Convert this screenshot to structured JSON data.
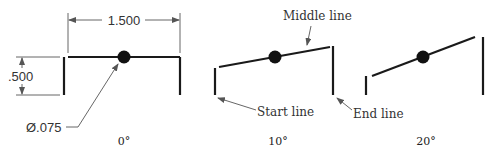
{
  "figure": {
    "panels": [
      {
        "angle_label": "0°",
        "dimensions": {
          "length": "1.500",
          "height": ".500",
          "dot_diameter": "Ø.075"
        }
      },
      {
        "angle_label": "10°",
        "callouts": {
          "middle": "Middle line",
          "start": "Start line",
          "end": "End line"
        }
      },
      {
        "angle_label": "20°"
      }
    ],
    "colors": {
      "line": "#1a1a1a",
      "dim": "#555555",
      "background": "#ffffff"
    }
  }
}
